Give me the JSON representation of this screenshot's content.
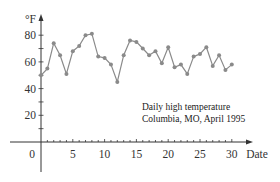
{
  "chart_data": {
    "type": "line",
    "title": "",
    "annotation": [
      "Daily high temperature",
      "Columbia, MO, April 1995"
    ],
    "xlabel": "Date",
    "ylabel": "°F",
    "xlim": [
      0,
      30
    ],
    "ylim": [
      0,
      90
    ],
    "x_ticks_labeled": [
      0,
      5,
      10,
      15,
      20,
      25,
      30
    ],
    "x_minor_tick_step": 1,
    "y_ticks_labeled": [
      20,
      40,
      60,
      80
    ],
    "y_minor_tick_step": 10,
    "grid": false,
    "legend": null,
    "x": [
      0,
      1,
      2,
      3,
      4,
      5,
      6,
      7,
      8,
      9,
      10,
      11,
      12,
      13,
      14,
      15,
      16,
      17,
      18,
      19,
      20,
      21,
      22,
      23,
      24,
      25,
      26,
      27,
      28,
      29,
      30
    ],
    "series": [
      {
        "name": "Daily high temperature",
        "color": "#8a8a8a",
        "marker": "circle",
        "values": [
          50,
          55,
          74,
          65,
          51,
          68,
          72,
          80,
          81,
          64,
          63,
          58,
          45,
          65,
          76,
          75,
          70,
          65,
          68,
          59,
          71,
          56,
          58,
          51,
          64,
          66,
          71,
          57,
          65,
          54,
          58
        ]
      }
    ]
  }
}
